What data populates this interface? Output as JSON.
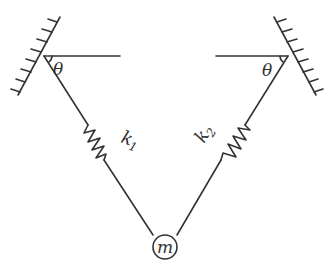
{
  "diagram": {
    "labels": {
      "theta_left": "θ",
      "theta_right": "θ",
      "spring_left": "k",
      "spring_left_sub": "1",
      "spring_right": "k",
      "spring_right_sub": "2",
      "mass": "m"
    },
    "colors": {
      "line": "#333333",
      "background": "#ffffff"
    }
  }
}
